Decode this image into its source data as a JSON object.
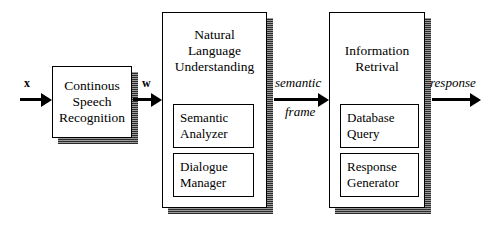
{
  "diagram": {
    "background_color": "#ffffff",
    "line_color": "#000000",
    "shadow_color": "#555555"
  },
  "stages": [
    {
      "id": "csr",
      "label": "Continous\nSpeech\nRecognition",
      "subcomponents": []
    },
    {
      "id": "nlu",
      "label": "Natural\nLanguage\nUnderstanding",
      "subcomponents": [
        {
          "id": "semantic-analyzer",
          "label": "Semantic\nAnalyzer"
        },
        {
          "id": "dialogue-manager",
          "label": "Dialogue\nManager"
        }
      ]
    },
    {
      "id": "ir",
      "label": "Information\nRetrival",
      "subcomponents": [
        {
          "id": "database-query",
          "label": "Database\nQuery"
        },
        {
          "id": "response-generator",
          "label": "Response\nGenerator"
        }
      ]
    }
  ],
  "edges": [
    {
      "id": "input-x",
      "label": "x",
      "style": "upright",
      "above": "x",
      "below": ""
    },
    {
      "id": "words-w",
      "label": "w",
      "style": "upright",
      "above": "w",
      "below": ""
    },
    {
      "id": "semantic-frame",
      "label": "semantic frame",
      "style": "italic",
      "above": "semantic",
      "below": "frame"
    },
    {
      "id": "response",
      "label": "response",
      "style": "italic",
      "above": "response",
      "below": ""
    }
  ]
}
